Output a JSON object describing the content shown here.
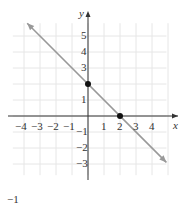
{
  "chart_data": {
    "type": "line",
    "title": "",
    "xlabel": "x",
    "ylabel": "y",
    "xlim": [
      -5,
      5
    ],
    "ylim": [
      -4,
      6
    ],
    "grid": true,
    "x_ticks": [
      -4,
      -3,
      -2,
      -1,
      1,
      2,
      3,
      4
    ],
    "y_ticks": [
      5,
      4,
      3,
      1,
      -1,
      -2,
      -3
    ],
    "x_tick_labels": [
      "−4",
      "−3",
      "−2",
      "−1",
      "1",
      "2",
      "3",
      "4"
    ],
    "y_tick_labels": [
      "5",
      "4",
      "3",
      "1",
      "−1",
      "−2",
      "−3"
    ],
    "series": [
      {
        "name": "line",
        "equation": "y = -x + 2",
        "x": [
          -3.8,
          4.9
        ],
        "y": [
          5.8,
          -2.9
        ],
        "arrows": "both"
      }
    ],
    "points": [
      {
        "x": 0,
        "y": 2,
        "label": "y-intercept"
      },
      {
        "x": 2,
        "y": 0,
        "label": "x-intercept"
      }
    ]
  },
  "caption": "−1"
}
